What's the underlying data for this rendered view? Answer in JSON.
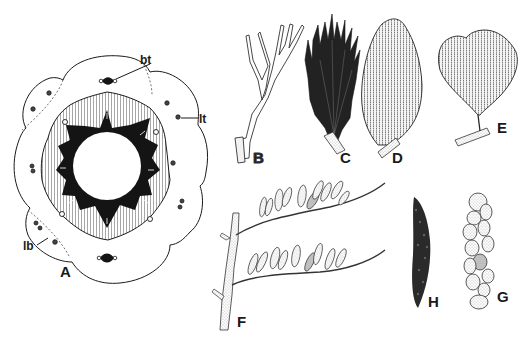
{
  "figure": {
    "panels": [
      {
        "id": "A",
        "label": "A",
        "description": "transverse section of stem"
      },
      {
        "id": "B",
        "label": "B",
        "description": "dichotomously branched axis"
      },
      {
        "id": "C",
        "label": "C",
        "description": "dense dark fan of narrow segments"
      },
      {
        "id": "D",
        "label": "D",
        "description": "elongate fan-shaped leaf with striate venation"
      },
      {
        "id": "E",
        "label": "E",
        "description": "broad fan-shaped leaf with striate venation"
      },
      {
        "id": "F",
        "label": "F",
        "description": "fertile branch with two rows of elongate sporangia"
      },
      {
        "id": "G",
        "label": "G",
        "description": "cluster of rounded sporangia"
      },
      {
        "id": "H",
        "label": "H",
        "description": "elongate cluster of small granules"
      }
    ],
    "annotations": [
      {
        "id": "bt",
        "text": "bt",
        "panel": "A"
      },
      {
        "id": "lt",
        "text": "lt",
        "panel": "A"
      },
      {
        "id": "lb",
        "text": "lb",
        "panel": "A"
      }
    ],
    "colors": {
      "ink": "#1a1a1a",
      "paper": "#ffffff",
      "stipple": "#8a8a8a"
    }
  }
}
